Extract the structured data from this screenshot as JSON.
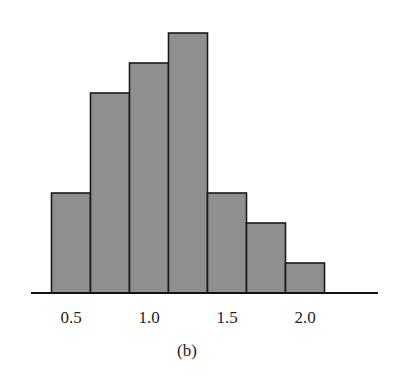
{
  "chart_data": {
    "type": "bar",
    "subtype": "histogram",
    "title": "",
    "caption": "(b)",
    "xlabel": "",
    "ylabel": "",
    "bins": [
      {
        "start": 0.375,
        "end": 0.625,
        "value": 10
      },
      {
        "start": 0.625,
        "end": 0.875,
        "value": 20
      },
      {
        "start": 0.875,
        "end": 1.125,
        "value": 23
      },
      {
        "start": 1.125,
        "end": 1.375,
        "value": 26
      },
      {
        "start": 1.375,
        "end": 1.625,
        "value": 10
      },
      {
        "start": 1.625,
        "end": 1.875,
        "value": 7
      },
      {
        "start": 1.875,
        "end": 2.125,
        "value": 3
      }
    ],
    "categories": [
      "0.5",
      "0.75",
      "1.0",
      "1.25",
      "1.5",
      "1.75",
      "2.0"
    ],
    "values": [
      10,
      20,
      23,
      26,
      10,
      7,
      3
    ],
    "xticks": [
      {
        "value": 0.5,
        "label": "0.5"
      },
      {
        "value": 1.0,
        "label": "1.0"
      },
      {
        "value": 1.5,
        "label": "1.5"
      },
      {
        "value": 2.0,
        "label": "2.0"
      }
    ],
    "xlim": [
      0.2,
      2.45
    ],
    "ylim": [
      0,
      26
    ],
    "y_axis_visible": false,
    "grid": false,
    "legend": null,
    "bar_color": "#8f8f8f",
    "edge_color": "#1a1a1a"
  },
  "layout": {
    "plot_left_px": 31,
    "plot_right_px": 378,
    "baseline_px": 293,
    "x_origin_value": 0.5,
    "x_origin_px": 71,
    "px_per_unit": 156,
    "px_per_count": 10
  }
}
